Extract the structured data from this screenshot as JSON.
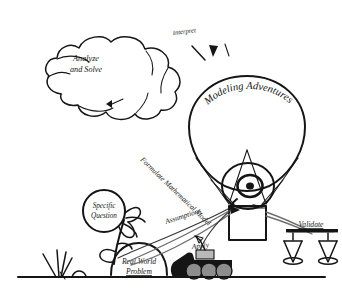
{
  "diagram": {
    "title": "Modeling Adventures",
    "background_color": "#ffffff",
    "ink_color": "#151515",
    "rope_color": "#6e6e6e",
    "style": "hand-drawn pen sketch"
  },
  "labels": {
    "cloud": "Analyze\nand Solve",
    "cloud_line_1": "Analyze",
    "cloud_line_2": "and Solve",
    "interpret": "Interpret",
    "balloon": "Modeling Adventures",
    "formulate": "Formulate Mathematical Model",
    "specific_question_line_1": "Specific",
    "specific_question_line_2": "Question",
    "assumptions": "Assumptions",
    "apply": "Apply",
    "validate": "Validate",
    "real_world_line_1": "Real World",
    "real_world_line_2": "Problem"
  },
  "elements": {
    "cloud": "thought-cloud",
    "arrow_cloud": "arrowhead-down-left",
    "arrow_interpret": "arrowhead-up-left",
    "balloon": "hot-air-balloon",
    "burner": "spiral-burner",
    "basket": "balloon-basket",
    "flower": "specific-question-flower",
    "hill": "real-world-problem-hill",
    "tank": "apply-tank-vehicle",
    "scales": "validate-balance-scales",
    "grass": "grass-tuft",
    "ground": "ground-line"
  }
}
